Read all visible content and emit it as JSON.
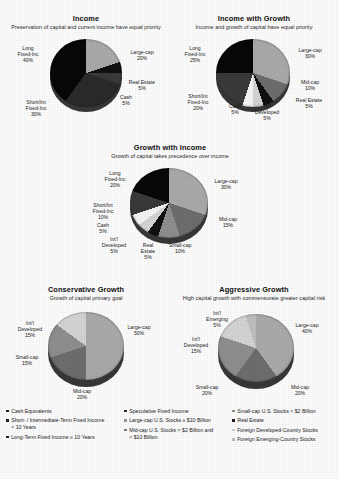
{
  "document": {
    "kind": "investment-allocation-models-page",
    "background": "#fdfdfd"
  },
  "palette": {
    "cash": "#f2f2f0",
    "short_int_fixed": "#3d3d3d",
    "long_fixed": "#0d0d0d",
    "speculative_fixed": "#272727",
    "large_cap": "#a9a9a7",
    "mid_cap": "#6f6f6e",
    "small_cap": "#8f8f8d",
    "real_estate": "#141414",
    "foreign_developed": "#d2d2d0",
    "foreign_emerging": "#bdbdbb",
    "pie_depth": "#3a3a3a"
  },
  "charts": [
    {
      "id": "income",
      "title": "Income",
      "subtitle": "Preservation of capital and current income have equal priority",
      "slices": [
        {
          "label": "Large-cap",
          "value": "20%",
          "key": "large_cap"
        },
        {
          "label": "Real Estate",
          "value": "5%",
          "key": "real_estate"
        },
        {
          "label": "Cash",
          "value": "5%",
          "key": "cash"
        },
        {
          "label": "Short/Int Fixed-Inc",
          "value": "30%",
          "key": "short_int_fixed"
        },
        {
          "label": "Long Fixed-Inc",
          "value": "40%",
          "key": "long_fixed"
        }
      ],
      "labels": {
        "long_fixed": "Long\nFixed-Inc\n40%",
        "large_cap": "Large-cap\n20%",
        "real_estate": "Real Estate\n5%",
        "cash": "Cash\n5%",
        "short_int": "Short/Int\nFixed-Inc\n30%"
      }
    },
    {
      "id": "income-with-growth",
      "title": "Income with Growth",
      "subtitle": "Income and growth of capital have equal priority",
      "slices": [
        {
          "label": "Large-cap",
          "value": "30%",
          "key": "large_cap"
        },
        {
          "label": "Mid-cap",
          "value": "10%",
          "key": "mid_cap"
        },
        {
          "label": "Real Estate",
          "value": "5%",
          "key": "real_estate"
        },
        {
          "label": "Int'l Developed",
          "value": "5%",
          "key": "foreign_developed"
        },
        {
          "label": "Cash",
          "value": "5%",
          "key": "cash"
        },
        {
          "label": "Short/Int Fixed-Inc",
          "value": "20%",
          "key": "short_int_fixed"
        },
        {
          "label": "Long Fixed-Inc",
          "value": "25%",
          "key": "long_fixed"
        }
      ],
      "labels": {
        "long_fixed": "Long\nFixed-Inc\n25%",
        "large_cap": "Large-cap\n30%",
        "mid_cap": "Mid-cap\n10%",
        "real_estate": "Real Estate\n5%",
        "intl_dev": "Int'l\nDeveloped\n5%",
        "cash": "Cash\n5%",
        "short_int": "Short/Int\nFixed-Inc\n20%"
      }
    },
    {
      "id": "growth-with-income",
      "title": "Growth with Income",
      "subtitle": "Growth of capital takes precedence over income",
      "slices": [
        {
          "label": "Large-cap",
          "value": "30%",
          "key": "large_cap"
        },
        {
          "label": "Mid-cap",
          "value": "15%",
          "key": "mid_cap"
        },
        {
          "label": "Small-cap",
          "value": "10%",
          "key": "small_cap"
        },
        {
          "label": "Real Estate",
          "value": "5%",
          "key": "real_estate"
        },
        {
          "label": "Int'l Developed",
          "value": "5%",
          "key": "foreign_developed"
        },
        {
          "label": "Cash",
          "value": "5%",
          "key": "cash"
        },
        {
          "label": "Short/Int Fixed-Inc",
          "value": "10%",
          "key": "short_int_fixed"
        },
        {
          "label": "Long Fixed-Inc",
          "value": "20%",
          "key": "long_fixed"
        }
      ],
      "labels": {
        "long_fixed": "Long\nFixed-Inc\n20%",
        "large_cap": "Large-cap\n30%",
        "mid_cap": "Mid-cap\n15%",
        "small_cap": "Small-cap\n10%",
        "real_estate": "Real\nEstate\n5%",
        "intl_dev": "Int'l\nDeveloped\n5%",
        "cash": "Cash\n5%",
        "short_int": "Short/Int\nFixed-Inc\n10%"
      }
    },
    {
      "id": "conservative-growth",
      "title": "Conservative Growth",
      "subtitle": "Growth of capital primary goal",
      "slices": [
        {
          "label": "Large-cap",
          "value": "50%",
          "key": "large_cap"
        },
        {
          "label": "Mid-cap",
          "value": "20%",
          "key": "mid_cap"
        },
        {
          "label": "Small-cap",
          "value": "15%",
          "key": "small_cap"
        },
        {
          "label": "Int'l Developed",
          "value": "15%",
          "key": "foreign_developed"
        }
      ],
      "labels": {
        "large_cap": "Large-cap\n50%",
        "mid_cap": "Mid-cap\n20%",
        "small_cap": "Small-cap\n15%",
        "intl_dev": "Int'l\nDeveloped\n15%"
      }
    },
    {
      "id": "aggressive-growth",
      "title": "Aggressive Growth",
      "subtitle": "High capital growth with commensurate greater capital risk",
      "slices": [
        {
          "label": "Large-cap",
          "value": "40%",
          "key": "large_cap"
        },
        {
          "label": "Mid-cap",
          "value": "20%",
          "key": "mid_cap"
        },
        {
          "label": "Small-cap",
          "value": "20%",
          "key": "small_cap"
        },
        {
          "label": "Int'l Developed",
          "value": "15%",
          "key": "foreign_developed"
        },
        {
          "label": "Int'l Emerging",
          "value": "5%",
          "key": "foreign_emerging"
        }
      ],
      "labels": {
        "large_cap": "Large-cap\n40%",
        "mid_cap": "Mid-cap\n20%",
        "small_cap": "Small-cap\n20%",
        "intl_dev": "Int'l\nDeveloped\n15%",
        "intl_emrg": "Int'l\nEmerging\n5%"
      }
    }
  ],
  "legend": {
    "columns": [
      {
        "items": [
          {
            "text": "Cash Equivalents",
            "swatch": "#222222",
            "cont": ""
          },
          {
            "text": "Short- / Intermediate-Term Fixed Income",
            "swatch": "#222222",
            "cont": "< 10 Years"
          },
          {
            "text": "Long-Term Fixed Income  ≥ 10 Years",
            "swatch": "#222222",
            "cont": ""
          }
        ]
      },
      {
        "items": [
          {
            "text": "Speculative Fixed Income",
            "swatch": "#2a2a2a",
            "cont": ""
          },
          {
            "text": "Large-cap U.S. Stocks  ≥ $10 Billion",
            "swatch": "#9a9a98",
            "cont": ""
          },
          {
            "text": "Mid-cap U.S. Stocks  > $2 Billion and",
            "swatch": "#7a7a79",
            "cont": "< $10 Billion"
          }
        ]
      },
      {
        "items": [
          {
            "text": "Small-cap U.S. Stocks < $2 Billion",
            "swatch": "#8c8c8a",
            "cont": ""
          },
          {
            "text": "Real Estate",
            "swatch": "#1a1a1a",
            "cont": ""
          },
          {
            "text": "Foreign Developed-Country Stocks",
            "swatch": "#cfcfcd",
            "cont": ""
          },
          {
            "text": "Foreign Emerging-Country Stocks",
            "swatch": "#bcbcba",
            "cont": ""
          }
        ]
      }
    ]
  }
}
